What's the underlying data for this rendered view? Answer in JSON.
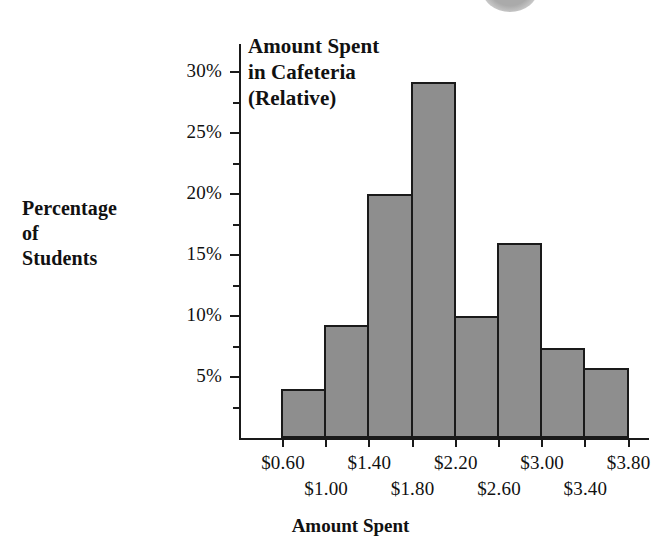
{
  "chart_data": {
    "type": "bar",
    "title": "Amount Spent in Cafeteria (Relative)",
    "title_lines": [
      "Amount Spent",
      "in Cafeteria",
      "(Relative)"
    ],
    "xlabel": "Amount Spent",
    "ylabel": "Percentage of Students",
    "ylabel_lines": [
      "Percentage",
      "of",
      "Students"
    ],
    "ylim": [
      0,
      31
    ],
    "ytick_values": [
      5,
      10,
      15,
      20,
      25,
      30
    ],
    "ytick_labels": [
      "5%",
      "10%",
      "15%",
      "20%",
      "25%",
      "30%"
    ],
    "yminor_values": [
      2.5,
      7.5,
      12.5,
      17.5,
      22.5,
      27.5
    ],
    "grid": false,
    "legend": "none",
    "bin_edges": [
      "$0.60",
      "$1.00",
      "$1.40",
      "$1.80",
      "$2.20",
      "$2.60",
      "$3.00",
      "$3.40",
      "$3.80"
    ],
    "xtick_labels_row_a": [
      "$0.60",
      "$1.40",
      "$2.20",
      "$3.00",
      "$3.80"
    ],
    "xtick_labels_row_b": [
      "$1.00",
      "$1.80",
      "$2.60",
      "$3.40"
    ],
    "categories": [
      "$0.60-$1.00",
      "$1.00-$1.40",
      "$1.40-$1.80",
      "$1.80-$2.20",
      "$2.20-$2.60",
      "$2.60-$3.00",
      "$3.00-$3.40",
      "$3.40-$3.80"
    ],
    "values": [
      4.0,
      9.3,
      20.0,
      29.2,
      10.0,
      16.0,
      7.4,
      5.7
    ],
    "bar_color": "#8e8e8e",
    "bar_edge_color": "#1a1a1a",
    "axis_color": "#1a1a1a"
  }
}
